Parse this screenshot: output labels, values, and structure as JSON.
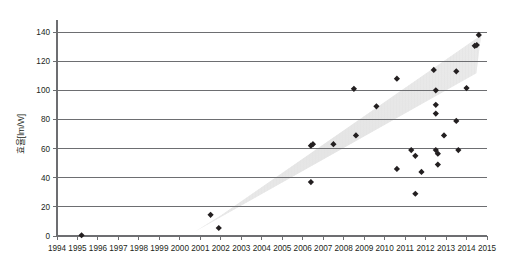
{
  "chart_data": {
    "type": "scatter",
    "title": "",
    "xlabel": "",
    "ylabel": "효율[lm/W]",
    "xlim": [
      1994,
      2015
    ],
    "ylim": [
      0,
      140
    ],
    "grid": true,
    "legend": false,
    "x_ticks": [
      "1994",
      "1995",
      "1996",
      "1997",
      "1998",
      "1999",
      "2000",
      "2001",
      "2002",
      "2003",
      "2004",
      "2005",
      "2006",
      "2007",
      "2008",
      "2009",
      "2010",
      "2011",
      "2012",
      "2013",
      "2014",
      "2015"
    ],
    "y_ticks": [
      "0",
      "20",
      "40",
      "60",
      "80",
      "100",
      "120",
      "140"
    ],
    "annotations": [
      {
        "name": "trend-band",
        "type": "shaded-band",
        "description": "diagonal hatched band indicating upward efficiency trend",
        "color": "#e8e8e8",
        "from": [
          2001.4,
          6
        ],
        "to": [
          2014.2,
          128
        ]
      }
    ],
    "series": [
      {
        "name": "LED efficacy",
        "marker": "diamond",
        "color": "#231f20",
        "points": [
          {
            "x": 1995.2,
            "y": 0.5
          },
          {
            "x": 2001.5,
            "y": 14.5
          },
          {
            "x": 2001.9,
            "y": 5.5
          },
          {
            "x": 2006.4,
            "y": 62.0
          },
          {
            "x": 2006.5,
            "y": 63.0
          },
          {
            "x": 2006.4,
            "y": 37.0
          },
          {
            "x": 2007.5,
            "y": 63.0
          },
          {
            "x": 2008.5,
            "y": 101.0
          },
          {
            "x": 2008.6,
            "y": 69.0
          },
          {
            "x": 2009.6,
            "y": 89.0
          },
          {
            "x": 2010.6,
            "y": 108.0
          },
          {
            "x": 2010.6,
            "y": 46.0
          },
          {
            "x": 2011.3,
            "y": 59.0
          },
          {
            "x": 2011.5,
            "y": 55.0
          },
          {
            "x": 2011.5,
            "y": 29.0
          },
          {
            "x": 2011.8,
            "y": 44.0
          },
          {
            "x": 2012.4,
            "y": 114.0
          },
          {
            "x": 2012.5,
            "y": 100.0
          },
          {
            "x": 2012.5,
            "y": 90.0
          },
          {
            "x": 2012.5,
            "y": 84.0
          },
          {
            "x": 2012.5,
            "y": 59.0
          },
          {
            "x": 2012.6,
            "y": 56.5
          },
          {
            "x": 2012.6,
            "y": 49.0
          },
          {
            "x": 2012.9,
            "y": 69.0
          },
          {
            "x": 2013.5,
            "y": 113.0
          },
          {
            "x": 2013.5,
            "y": 79.0
          },
          {
            "x": 2013.6,
            "y": 59.0
          },
          {
            "x": 2014.0,
            "y": 101.5
          },
          {
            "x": 2014.4,
            "y": 130.5
          },
          {
            "x": 2014.5,
            "y": 131.0
          },
          {
            "x": 2014.6,
            "y": 138.0
          }
        ]
      }
    ]
  }
}
